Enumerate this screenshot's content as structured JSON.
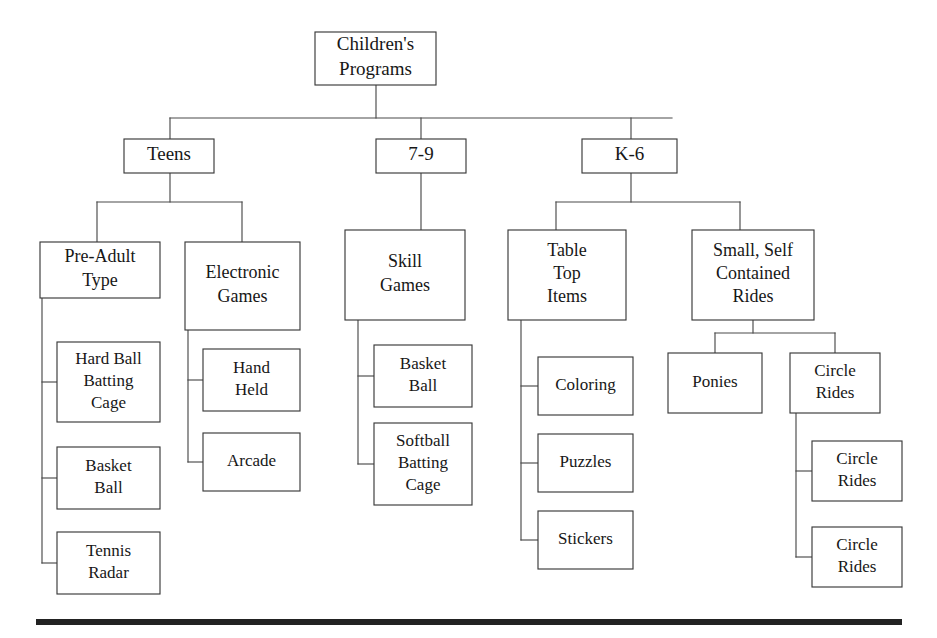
{
  "diagram": {
    "type": "organizational-tree",
    "orientation": "top-down",
    "bottom_rule": {
      "x": 36,
      "y": 619,
      "width": 866,
      "height": 6,
      "color": "#222222"
    },
    "style": {
      "box_fill": "#ffffff",
      "box_stroke": "#3a3a3a",
      "connector_stroke": "#4a4a4a",
      "text_color": "#171717",
      "background": "#ffffff"
    },
    "nodes": [
      {
        "id": "root",
        "label": "Children's Programs",
        "lines": [
          "Children's",
          "Programs"
        ],
        "x": 315,
        "y": 32,
        "w": 121,
        "h": 53,
        "font_size": 19,
        "level": 0
      },
      {
        "id": "teens",
        "label": "Teens",
        "lines": [
          "Teens"
        ],
        "x": 124,
        "y": 139,
        "w": 90,
        "h": 34,
        "font_size": 19,
        "level": 1
      },
      {
        "id": "seven-nine",
        "label": "7-9",
        "lines": [
          "7-9"
        ],
        "x": 376,
        "y": 139,
        "w": 90,
        "h": 34,
        "font_size": 19,
        "level": 1
      },
      {
        "id": "k-6",
        "label": "K-6",
        "lines": [
          "K-6"
        ],
        "x": 582,
        "y": 139,
        "w": 95,
        "h": 34,
        "font_size": 19,
        "level": 1
      },
      {
        "id": "pre-adult-type",
        "label": "Pre-Adult Type",
        "lines": [
          "Pre-Adult",
          "Type"
        ],
        "x": 40,
        "y": 242,
        "w": 120,
        "h": 56,
        "font_size": 18,
        "level": 2
      },
      {
        "id": "electronic-games",
        "label": "Electronic Games",
        "lines": [
          "Electronic",
          "Games"
        ],
        "x": 185,
        "y": 242,
        "w": 115,
        "h": 88,
        "font_size": 18,
        "level": 2
      },
      {
        "id": "skill-games",
        "label": "Skill Games",
        "lines": [
          "Skill",
          "Games"
        ],
        "x": 345,
        "y": 230,
        "w": 120,
        "h": 90,
        "font_size": 18,
        "level": 2
      },
      {
        "id": "table-top-items",
        "label": "Table Top Items",
        "lines": [
          "Table",
          "Top",
          "Items"
        ],
        "x": 508,
        "y": 230,
        "w": 118,
        "h": 90,
        "font_size": 18,
        "level": 2
      },
      {
        "id": "small-self-contained-rides",
        "label": "Small, Self Contained Rides",
        "lines": [
          "Small, Self",
          "Contained",
          "Rides"
        ],
        "x": 692,
        "y": 230,
        "w": 122,
        "h": 90,
        "font_size": 18,
        "level": 2
      },
      {
        "id": "hard-ball-batting-cage",
        "label": "Hard Ball Batting Cage",
        "lines": [
          "Hard Ball",
          "Batting",
          "Cage"
        ],
        "x": 57,
        "y": 342,
        "w": 103,
        "h": 80,
        "font_size": 17,
        "level": 3
      },
      {
        "id": "basket-ball-teens",
        "label": "Basket Ball",
        "lines": [
          "Basket",
          "Ball"
        ],
        "x": 57,
        "y": 447,
        "w": 103,
        "h": 62,
        "font_size": 17,
        "level": 3
      },
      {
        "id": "tennis-radar",
        "label": "Tennis Radar",
        "lines": [
          "Tennis",
          "Radar"
        ],
        "x": 57,
        "y": 532,
        "w": 103,
        "h": 62,
        "font_size": 17,
        "level": 3
      },
      {
        "id": "hand-held",
        "label": "Hand Held",
        "lines": [
          "Hand",
          "Held"
        ],
        "x": 203,
        "y": 349,
        "w": 97,
        "h": 62,
        "font_size": 17,
        "level": 3
      },
      {
        "id": "arcade",
        "label": "Arcade",
        "lines": [
          "Arcade"
        ],
        "x": 203,
        "y": 433,
        "w": 97,
        "h": 58,
        "font_size": 17,
        "level": 3
      },
      {
        "id": "basket-ball-skill",
        "label": "Basket Ball",
        "lines": [
          "Basket",
          "Ball"
        ],
        "x": 374,
        "y": 345,
        "w": 98,
        "h": 62,
        "font_size": 17,
        "level": 3
      },
      {
        "id": "softball-batting-cage",
        "label": "Softball Batting Cage",
        "lines": [
          "Softball",
          "Batting",
          "Cage"
        ],
        "x": 374,
        "y": 423,
        "w": 98,
        "h": 82,
        "font_size": 17,
        "level": 3
      },
      {
        "id": "coloring",
        "label": "Coloring",
        "lines": [
          "Coloring"
        ],
        "x": 538,
        "y": 357,
        "w": 95,
        "h": 58,
        "font_size": 17,
        "level": 3
      },
      {
        "id": "puzzles",
        "label": "Puzzles",
        "lines": [
          "Puzzles"
        ],
        "x": 538,
        "y": 434,
        "w": 95,
        "h": 58,
        "font_size": 17,
        "level": 3
      },
      {
        "id": "stickers",
        "label": "Stickers",
        "lines": [
          "Stickers"
        ],
        "x": 538,
        "y": 511,
        "w": 95,
        "h": 58,
        "font_size": 17,
        "level": 3
      },
      {
        "id": "ponies",
        "label": "Ponies",
        "lines": [
          "Ponies"
        ],
        "x": 668,
        "y": 353,
        "w": 94,
        "h": 60,
        "font_size": 17,
        "level": 3
      },
      {
        "id": "circle-rides-parent",
        "label": "Circle Rides",
        "lines": [
          "Circle",
          "Rides"
        ],
        "x": 790,
        "y": 353,
        "w": 90,
        "h": 60,
        "font_size": 17,
        "level": 3
      },
      {
        "id": "circle-rides-child-1",
        "label": "Circle Rides",
        "lines": [
          "Circle",
          "Rides"
        ],
        "x": 812,
        "y": 441,
        "w": 90,
        "h": 60,
        "font_size": 17,
        "level": 4
      },
      {
        "id": "circle-rides-child-2",
        "label": "Circle Rides",
        "lines": [
          "Circle",
          "Rides"
        ],
        "x": 812,
        "y": 527,
        "w": 90,
        "h": 60,
        "font_size": 17,
        "level": 4
      }
    ],
    "connectors": [
      {
        "id": "root-stem",
        "points": "376,85 376,118"
      },
      {
        "id": "level1-bus",
        "points": "170,118 672,118"
      },
      {
        "id": "drop-teens",
        "points": "170,118 170,139"
      },
      {
        "id": "drop-seven-nine",
        "points": "421,118 421,139"
      },
      {
        "id": "drop-k6",
        "points": "631,118 631,139"
      },
      {
        "id": "teens-stem",
        "points": "170,173 170,202"
      },
      {
        "id": "teens-bus",
        "points": "97,202 242,202"
      },
      {
        "id": "drop-pre-adult",
        "points": "97,202 97,242"
      },
      {
        "id": "drop-electronic",
        "points": "242,202 242,242"
      },
      {
        "id": "seven-nine-stem",
        "points": "421,173 421,230"
      },
      {
        "id": "k6-stem",
        "points": "631,173 631,202"
      },
      {
        "id": "k6-bus",
        "points": "556,202 740,202"
      },
      {
        "id": "drop-table-top",
        "points": "556,202 556,230"
      },
      {
        "id": "drop-small-rides",
        "points": "740,202 740,230"
      },
      {
        "id": "pre-adult-spine",
        "points": "42,298 42,563"
      },
      {
        "id": "stub-hardball",
        "points": "42,382 57,382"
      },
      {
        "id": "stub-basketball",
        "points": "42,478 57,478"
      },
      {
        "id": "stub-tennis",
        "points": "42,563 57,563"
      },
      {
        "id": "electronic-spine",
        "points": "188,330 188,462"
      },
      {
        "id": "stub-handheld",
        "points": "188,380 203,380"
      },
      {
        "id": "stub-arcade",
        "points": "188,462 203,462"
      },
      {
        "id": "skill-spine",
        "points": "358,320 358,464"
      },
      {
        "id": "stub-basket-skill",
        "points": "358,376 374,376"
      },
      {
        "id": "stub-softball",
        "points": "358,464 374,464"
      },
      {
        "id": "table-spine",
        "points": "521,320 521,540"
      },
      {
        "id": "stub-coloring",
        "points": "521,386 538,386"
      },
      {
        "id": "stub-puzzles",
        "points": "521,463 538,463"
      },
      {
        "id": "stub-stickers",
        "points": "521,540 538,540"
      },
      {
        "id": "rides-stem",
        "points": "753,320 753,333"
      },
      {
        "id": "rides-bus",
        "points": "715,333 835,333"
      },
      {
        "id": "drop-ponies",
        "points": "715,333 715,353"
      },
      {
        "id": "drop-circle",
        "points": "835,333 835,353"
      },
      {
        "id": "circle-spine",
        "points": "796,413 796,557"
      },
      {
        "id": "stub-circle-1",
        "points": "796,471 812,471"
      },
      {
        "id": "stub-circle-2",
        "points": "796,557 812,557"
      }
    ]
  }
}
